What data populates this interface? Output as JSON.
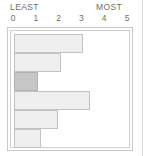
{
  "chart_data": {
    "type": "bar",
    "orientation": "horizontal",
    "title": "",
    "subtitle": "",
    "xlabel": "",
    "ylabel": "",
    "xlim": [
      0,
      5
    ],
    "ylim": null,
    "grid": false,
    "legend": null,
    "legend_position": "none",
    "axis_end_labels": {
      "left": "LEAST",
      "right": "MOST"
    },
    "tick_labels": [
      "0",
      "1",
      "2",
      "3",
      "4",
      "5"
    ],
    "tick_values": [
      0,
      1,
      2,
      3,
      4,
      5
    ],
    "categories": [
      "",
      "",
      "",
      "",
      "",
      ""
    ],
    "values": [
      3.1,
      2.1,
      1.05,
      3.4,
      1.95,
      1.2
    ],
    "highlighted_index": 2,
    "annotations": []
  },
  "scale": {
    "least_label": "LEAST",
    "most_label": "MOST"
  },
  "colors": {
    "bar_fill": "#efefef",
    "bar_stroke": "#c3c3c3",
    "bar_highlight_fill": "#c6c6c6",
    "bar_highlight_stroke": "#b2b2b2",
    "frame_stroke": "#c9c9c9",
    "text": "#6e6e6e",
    "background": "#ffffff"
  }
}
